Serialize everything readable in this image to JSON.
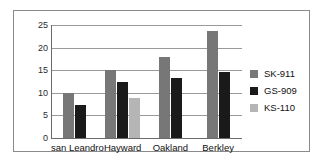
{
  "chart_data": {
    "type": "bar",
    "title": "",
    "xlabel": "",
    "ylabel": "",
    "ylim": [
      0,
      25
    ],
    "yticks": [
      0,
      5,
      10,
      15,
      20,
      25
    ],
    "grid": true,
    "legend_position": "right",
    "categories": [
      "san Leandro",
      "Hayward",
      "Oakland",
      "Berkley"
    ],
    "series": [
      {
        "name": "SK-911",
        "color": "#777777",
        "values": [
          10,
          15,
          18,
          23.7
        ]
      },
      {
        "name": "GS-909",
        "color": "#1a1a1a",
        "values": [
          7.3,
          12.4,
          13.2,
          14.7
        ]
      },
      {
        "name": "KS-110",
        "color": "#b5b5b5",
        "values": [
          null,
          8.8,
          null,
          null
        ]
      }
    ]
  },
  "axis": {
    "ytick_labels": [
      "25",
      "20",
      "15",
      "10",
      "5",
      "0"
    ]
  },
  "legend": {
    "items": [
      {
        "label": "SK-911",
        "color": "#777777"
      },
      {
        "label": "GS-909",
        "color": "#1a1a1a"
      },
      {
        "label": "KS-110",
        "color": "#b5b5b5"
      }
    ]
  },
  "categories_labels": [
    "san Leandro",
    "Hayward",
    "Oakland",
    "Berkley"
  ]
}
